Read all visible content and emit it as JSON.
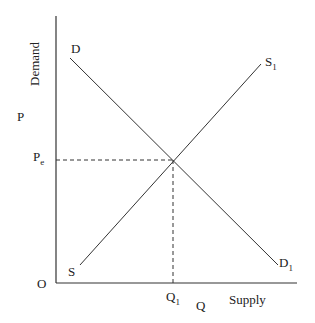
{
  "diagram": {
    "type": "supply-demand",
    "axes": {
      "y_label": "P",
      "y_label_rotated": "Demand",
      "x_label": "Q",
      "x_label_right": "Supply",
      "origin": "O"
    },
    "curves": {
      "demand": {
        "start_label": "D",
        "end_label": "D",
        "end_sub": "1"
      },
      "supply": {
        "start_label": "S",
        "end_label": "S",
        "end_sub": "1"
      }
    },
    "equilibrium": {
      "price_label": "P",
      "price_sub": "e",
      "quantity_label": "Q",
      "quantity_sub": "1"
    },
    "colors": {
      "line": "#333333",
      "background": "#ffffff"
    }
  }
}
